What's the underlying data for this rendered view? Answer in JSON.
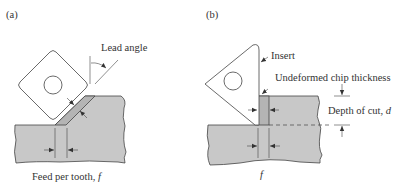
{
  "figure": {
    "panel_a": {
      "label": "(a)",
      "annotations": {
        "lead_angle": "Lead angle",
        "feed_per_tooth": "Feed per tooth, ",
        "feed_symbol": "f"
      }
    },
    "panel_b": {
      "label": "(b)",
      "annotations": {
        "insert": "Insert",
        "undeformed_chip_thickness": "Undeformed chip thickness",
        "depth_of_cut": "Depth of cut, ",
        "depth_symbol": "d",
        "feed_symbol": "f"
      }
    },
    "colors": {
      "workpiece": "#c8c8c8",
      "chip": "#b4b4b4",
      "outline": "#444444"
    }
  }
}
